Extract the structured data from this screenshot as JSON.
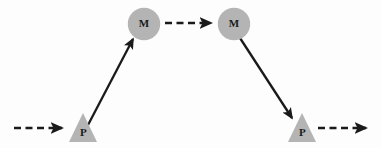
{
  "diagram": {
    "type": "flow-diagram",
    "background_color": "#fdfdfd",
    "shape_fill_color": "#b4b4b4",
    "line_color": "#1a1a1a",
    "label_color": "#1a1a1a",
    "nodes": [
      {
        "id": "p-left",
        "label": "P",
        "shape": "triangle",
        "x": 83,
        "y": 129,
        "width": 28,
        "height": 30
      },
      {
        "id": "m-left",
        "label": "M",
        "shape": "circle",
        "x": 144,
        "y": 24,
        "radius": 16
      },
      {
        "id": "m-right",
        "label": "M",
        "shape": "circle",
        "x": 234,
        "y": 24,
        "radius": 16
      },
      {
        "id": "p-right",
        "label": "P",
        "shape": "triangle",
        "x": 302,
        "y": 129,
        "width": 28,
        "height": 30
      }
    ],
    "edges": [
      {
        "id": "edge-in",
        "style": "dashed",
        "from": "boundary-left",
        "to": "p-left",
        "x1": 14,
        "y1": 128,
        "x2": 66,
        "y2": 128
      },
      {
        "id": "edge-p-left-to-m-left",
        "style": "solid",
        "from": "p-left",
        "to": "m-left",
        "x1": 88,
        "y1": 125,
        "x2": 135,
        "y2": 37
      },
      {
        "id": "edge-m-left-to-m-right",
        "style": "dashed",
        "from": "m-left",
        "to": "m-right",
        "x1": 164,
        "y1": 23,
        "x2": 214,
        "y2": 23
      },
      {
        "id": "edge-m-right-to-p-right",
        "style": "solid",
        "from": "m-right",
        "to": "p-right",
        "x1": 240,
        "y1": 38,
        "x2": 294,
        "y2": 121
      },
      {
        "id": "edge-out",
        "style": "dashed",
        "from": "p-right",
        "to": "boundary-right",
        "x1": 318,
        "y1": 128,
        "x2": 370,
        "y2": 128
      }
    ]
  }
}
